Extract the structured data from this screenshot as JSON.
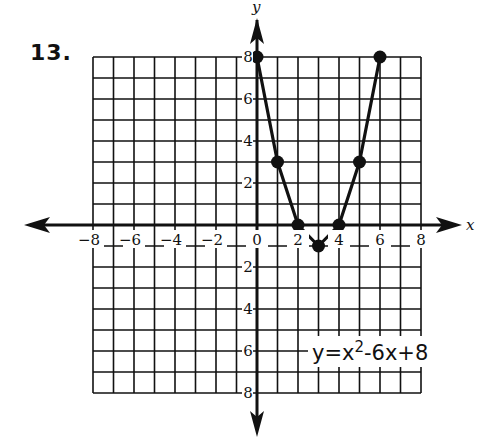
{
  "problem": {
    "number": "13."
  },
  "equation": {
    "lhs": "y=x",
    "exp": "2",
    "rhs": "-6x+8"
  },
  "axes": {
    "x_name": "x",
    "y_name": "y",
    "x_ticks": [
      "-8",
      "-6",
      "-4",
      "-2",
      "0",
      "2",
      "4",
      "6",
      "8"
    ],
    "y_ticks": [
      "8",
      "6",
      "4",
      "2",
      "2",
      "4",
      "6",
      "8"
    ]
  },
  "colors": {
    "ink": "#111111",
    "background": "#ffffff"
  },
  "chart_data": {
    "type": "line",
    "title": "13.",
    "annotation": "y = x^2 - 6x + 8",
    "xlabel": "x",
    "ylabel": "y",
    "xlim": [
      -8,
      8
    ],
    "ylim": [
      -8,
      8
    ],
    "grid": true,
    "x_tick_labels": [
      "-8",
      "-6",
      "-4",
      "-2",
      "0",
      "2",
      "4",
      "6",
      "8"
    ],
    "y_tick_labels": [
      "8",
      "6",
      "4",
      "2",
      "2",
      "4",
      "6",
      "8"
    ],
    "series": [
      {
        "name": "y=x^2-6x+8",
        "x": [
          0,
          1,
          2,
          3,
          4,
          5,
          6
        ],
        "y": [
          8,
          3,
          0,
          -1,
          0,
          3,
          8
        ],
        "markers": true
      }
    ]
  }
}
